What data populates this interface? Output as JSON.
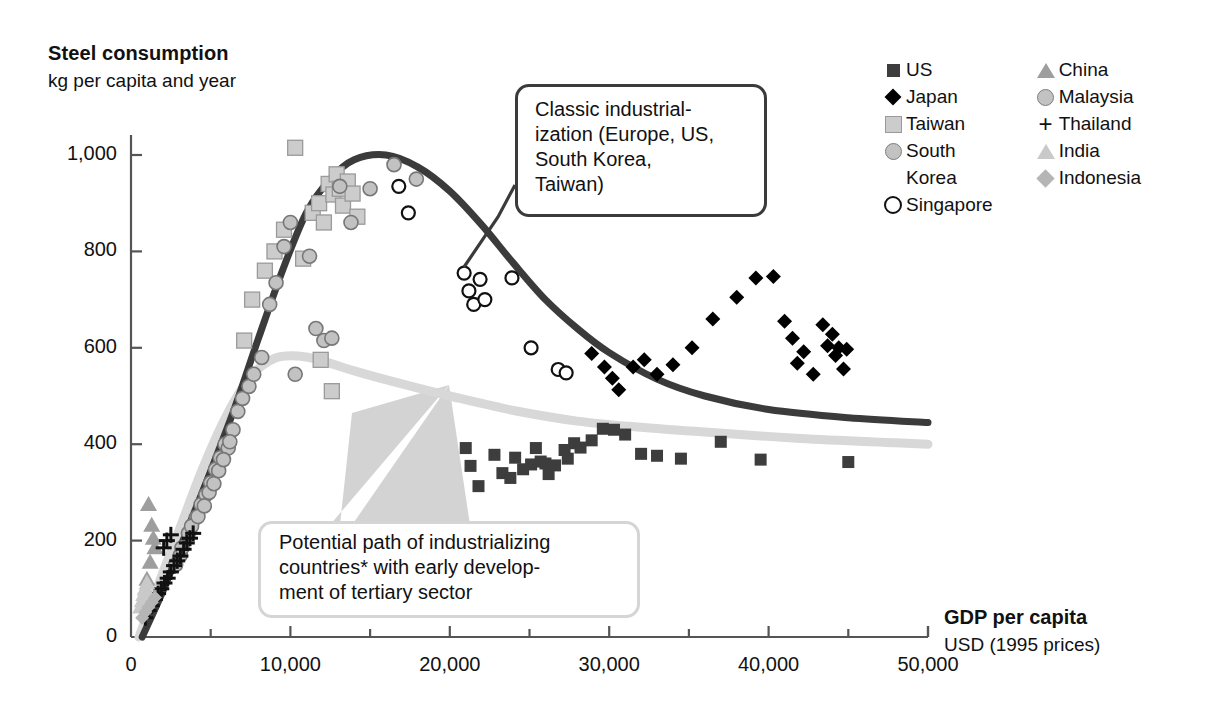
{
  "title": {
    "main": "Steel consumption",
    "sub": "kg per capita and year"
  },
  "xaxis_label": {
    "main": "GDP per capita",
    "sub": "USD (1995 prices)"
  },
  "callouts": [
    {
      "id": "classic",
      "text": "Classic industrial-\nization (Europe, US,\nSouth Korea,\nTaiwan)",
      "border_color": "#3b3b3b"
    },
    {
      "id": "potential",
      "text": "Potential path of industrializing\ncountries* with early develop-\nment of tertiary sector",
      "border_color": "#d5d5d5"
    }
  ],
  "legend": {
    "columns": [
      [
        {
          "label": "US",
          "marker": "square-dark",
          "color": "#3d3d3d"
        },
        {
          "label": "Japan",
          "marker": "diamond-black",
          "color": "#000000"
        },
        {
          "label": "Taiwan",
          "marker": "square-light",
          "color": "#cccccc"
        },
        {
          "label": "South",
          "label2": "Korea",
          "marker": "circle-gray",
          "color": "#c2c2c2"
        },
        {
          "label": "Singapore",
          "marker": "circle-open",
          "color": "#ffffff"
        }
      ],
      [
        {
          "label": "China",
          "marker": "triangle-gray",
          "color": "#9e9e9e"
        },
        {
          "label": "Malaysia",
          "marker": "circle-gray",
          "color": "#c2c2c2"
        },
        {
          "label": "Thailand",
          "marker": "plus",
          "color": "#111111"
        },
        {
          "label": "India",
          "marker": "triangle-light",
          "color": "#c9c9c9"
        },
        {
          "label": "Indonesia",
          "marker": "diamond-gray",
          "color": "#b5b5b5"
        }
      ]
    ]
  },
  "chart_data": {
    "type": "scatter",
    "title": "Steel consumption",
    "subtitle": "kg per capita and year",
    "xlabel": "GDP per capita",
    "xlabel_sub": "USD (1995 prices)",
    "ylabel": "Steel consumption",
    "ylabel_sub": "kg per capita and year",
    "xlim": [
      0,
      50000
    ],
    "ylim": [
      0,
      1080
    ],
    "grid": false,
    "legend_position": "top-right",
    "xticks": [
      0,
      10000,
      20000,
      30000,
      40000,
      50000
    ],
    "xticklabels": [
      "0",
      "10,000",
      "20,000",
      "30,000",
      "40,000",
      "50,000"
    ],
    "xminorticks": [
      5000,
      15000,
      25000,
      35000,
      45000
    ],
    "yticks": [
      0,
      200,
      400,
      600,
      800,
      1000
    ],
    "yticklabels": [
      "0",
      "200",
      "400",
      "600",
      "800",
      "1,000"
    ],
    "annotations": [
      "Classic industrialization (Europe, US, South Korea, Taiwan)",
      "Potential path of industrializing countries* with early development of tertiary sector"
    ],
    "curves": [
      {
        "name": "Classic industrialization path",
        "color": "#3b3b3b",
        "width": 7,
        "points": [
          [
            700,
            0
          ],
          [
            2000,
            95
          ],
          [
            3500,
            220
          ],
          [
            5000,
            345
          ],
          [
            6500,
            475
          ],
          [
            8000,
            620
          ],
          [
            9500,
            760
          ],
          [
            11000,
            880
          ],
          [
            12500,
            950
          ],
          [
            14000,
            990
          ],
          [
            16000,
            1000
          ],
          [
            18000,
            975
          ],
          [
            20000,
            925
          ],
          [
            22000,
            855
          ],
          [
            24000,
            775
          ],
          [
            26000,
            700
          ],
          [
            28000,
            640
          ],
          [
            30000,
            590
          ],
          [
            33000,
            535
          ],
          [
            36000,
            500
          ],
          [
            40000,
            472
          ],
          [
            45000,
            455
          ],
          [
            50000,
            445
          ]
        ]
      },
      {
        "name": "Potential path with early tertiary sector",
        "color": "#d8d8d8",
        "width": 9,
        "points": [
          [
            500,
            0
          ],
          [
            1500,
            90
          ],
          [
            3000,
            220
          ],
          [
            4500,
            350
          ],
          [
            6000,
            460
          ],
          [
            7500,
            540
          ],
          [
            9000,
            578
          ],
          [
            10500,
            583
          ],
          [
            12000,
            573
          ],
          [
            14000,
            552
          ],
          [
            17000,
            525
          ],
          [
            20000,
            500
          ],
          [
            24000,
            470
          ],
          [
            28000,
            448
          ],
          [
            32000,
            435
          ],
          [
            36000,
            425
          ],
          [
            42000,
            412
          ],
          [
            48000,
            403
          ],
          [
            50000,
            400
          ]
        ]
      }
    ],
    "series": [
      {
        "name": "US",
        "marker": "square-dark",
        "color": "#3d3d3d",
        "points": [
          [
            21000,
            392
          ],
          [
            21300,
            355
          ],
          [
            21800,
            313
          ],
          [
            22800,
            378
          ],
          [
            23300,
            340
          ],
          [
            23800,
            330
          ],
          [
            24100,
            372
          ],
          [
            24600,
            348
          ],
          [
            25100,
            358
          ],
          [
            25400,
            392
          ],
          [
            25700,
            364
          ],
          [
            26000,
            360
          ],
          [
            26200,
            338
          ],
          [
            26600,
            356
          ],
          [
            27200,
            388
          ],
          [
            27400,
            370
          ],
          [
            27800,
            402
          ],
          [
            28200,
            393
          ],
          [
            28900,
            408
          ],
          [
            29600,
            432
          ],
          [
            30300,
            430
          ],
          [
            31000,
            420
          ],
          [
            32000,
            380
          ],
          [
            33000,
            376
          ],
          [
            34500,
            370
          ],
          [
            37000,
            405
          ],
          [
            39500,
            368
          ],
          [
            45000,
            363
          ]
        ]
      },
      {
        "name": "Japan",
        "marker": "diamond-black",
        "color": "#000000",
        "points": [
          [
            28900,
            588
          ],
          [
            29700,
            560
          ],
          [
            30200,
            537
          ],
          [
            30600,
            513
          ],
          [
            31500,
            560
          ],
          [
            32200,
            575
          ],
          [
            33000,
            545
          ],
          [
            34000,
            565
          ],
          [
            35200,
            600
          ],
          [
            36500,
            660
          ],
          [
            38000,
            705
          ],
          [
            39200,
            745
          ],
          [
            40300,
            748
          ],
          [
            41000,
            655
          ],
          [
            41500,
            620
          ],
          [
            41800,
            568
          ],
          [
            42200,
            592
          ],
          [
            42800,
            545
          ],
          [
            43400,
            648
          ],
          [
            43700,
            604
          ],
          [
            44000,
            628
          ],
          [
            44200,
            584
          ],
          [
            44400,
            600
          ],
          [
            44700,
            556
          ],
          [
            44900,
            597
          ]
        ]
      },
      {
        "name": "Taiwan",
        "marker": "square-light",
        "color": "#cccccc",
        "points": [
          [
            7100,
            615
          ],
          [
            7600,
            700
          ],
          [
            8400,
            760
          ],
          [
            9000,
            800
          ],
          [
            9600,
            845
          ],
          [
            10300,
            1015
          ],
          [
            10800,
            785
          ],
          [
            11400,
            880
          ],
          [
            11800,
            900
          ],
          [
            12100,
            860
          ],
          [
            12400,
            940
          ],
          [
            12700,
            918
          ],
          [
            12900,
            960
          ],
          [
            13100,
            930
          ],
          [
            13300,
            895
          ],
          [
            13600,
            945
          ],
          [
            13900,
            920
          ],
          [
            14200,
            872
          ],
          [
            11900,
            575
          ],
          [
            12600,
            510
          ]
        ]
      },
      {
        "name": "South Korea",
        "marker": "circle-gray",
        "color": "#c2c2c2",
        "points": [
          [
            3100,
            170
          ],
          [
            3600,
            215
          ],
          [
            4100,
            248
          ],
          [
            4400,
            275
          ],
          [
            4700,
            295
          ],
          [
            5000,
            320
          ],
          [
            5300,
            348
          ],
          [
            5600,
            372
          ],
          [
            5900,
            400
          ],
          [
            6100,
            392
          ],
          [
            6400,
            430
          ],
          [
            6700,
            468
          ],
          [
            7000,
            495
          ],
          [
            7400,
            520
          ],
          [
            7700,
            545
          ],
          [
            8200,
            580
          ],
          [
            8700,
            690
          ],
          [
            9100,
            735
          ],
          [
            9600,
            810
          ],
          [
            10000,
            860
          ],
          [
            10300,
            545
          ],
          [
            11200,
            790
          ],
          [
            11600,
            640
          ],
          [
            12100,
            615
          ],
          [
            12600,
            620
          ],
          [
            13100,
            935
          ],
          [
            13800,
            860
          ],
          [
            15000,
            930
          ],
          [
            16500,
            980
          ],
          [
            17900,
            950
          ]
        ]
      },
      {
        "name": "Singapore",
        "marker": "circle-open",
        "color": "#ffffff",
        "points": [
          [
            16800,
            935
          ],
          [
            17400,
            880
          ],
          [
            20900,
            755
          ],
          [
            21200,
            718
          ],
          [
            21500,
            690
          ],
          [
            22200,
            700
          ],
          [
            21900,
            742
          ],
          [
            23900,
            745
          ],
          [
            25100,
            600
          ],
          [
            26800,
            555
          ],
          [
            27300,
            548
          ]
        ]
      },
      {
        "name": "China",
        "marker": "triangle-gray",
        "color": "#9e9e9e",
        "points": [
          [
            1100,
            275
          ],
          [
            1300,
            232
          ],
          [
            1400,
            205
          ],
          [
            1500,
            185
          ],
          [
            1200,
            155
          ],
          [
            1000,
            120
          ],
          [
            900,
            100
          ]
        ]
      },
      {
        "name": "Malaysia",
        "marker": "circle-gray",
        "color": "#c2c2c2",
        "points": [
          [
            2800,
            150
          ],
          [
            3200,
            185
          ],
          [
            3800,
            230
          ],
          [
            4200,
            250
          ],
          [
            4600,
            272
          ],
          [
            4900,
            300
          ],
          [
            5200,
            318
          ],
          [
            5500,
            345
          ],
          [
            5800,
            368
          ],
          [
            6200,
            405
          ]
        ]
      },
      {
        "name": "Thailand",
        "marker": "plus",
        "color": "#111111",
        "points": [
          [
            900,
            40
          ],
          [
            1100,
            55
          ],
          [
            1300,
            65
          ],
          [
            1500,
            78
          ],
          [
            1700,
            90
          ],
          [
            1900,
            100
          ],
          [
            2100,
            112
          ],
          [
            2300,
            122
          ],
          [
            2500,
            135
          ],
          [
            2700,
            148
          ],
          [
            2900,
            158
          ],
          [
            3100,
            168
          ],
          [
            3300,
            182
          ],
          [
            3500,
            195
          ],
          [
            3700,
            205
          ],
          [
            3900,
            215
          ],
          [
            2050,
            185
          ],
          [
            2250,
            200
          ],
          [
            2500,
            212
          ]
        ]
      },
      {
        "name": "India",
        "marker": "triangle-light",
        "color": "#c9c9c9",
        "points": [
          [
            600,
            62
          ],
          [
            700,
            75
          ],
          [
            800,
            88
          ],
          [
            900,
            100
          ],
          [
            1000,
            112
          ]
        ]
      },
      {
        "name": "Indonesia",
        "marker": "diamond-gray",
        "color": "#b5b5b5",
        "points": [
          [
            700,
            40
          ],
          [
            900,
            52
          ],
          [
            1100,
            62
          ],
          [
            1300,
            72
          ],
          [
            1500,
            82
          ]
        ]
      }
    ]
  }
}
